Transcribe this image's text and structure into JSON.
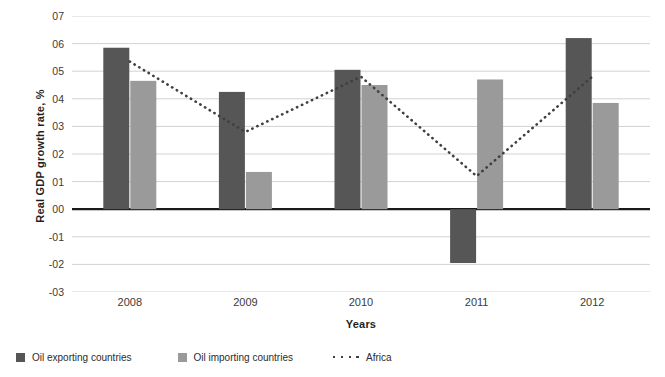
{
  "chart_data": {
    "type": "bar",
    "title": "",
    "xlabel": "Years",
    "ylabel": "Real GDP growth rate, %",
    "categories": [
      "2008",
      "2009",
      "2010",
      "2011",
      "2012"
    ],
    "ylim": [
      -0.03,
      0.07
    ],
    "yticks": [
      0.07,
      0.06,
      0.05,
      0.04,
      0.03,
      0.02,
      0.01,
      0.0,
      -0.01,
      -0.02,
      -0.03
    ],
    "ytick_labels": [
      "07",
      "06",
      "05",
      "04",
      "03",
      "02",
      "01",
      "00",
      "-01",
      "-02",
      "-03"
    ],
    "grid": true,
    "legend_position": "bottom-left",
    "series": [
      {
        "name": "Oil exporting countries",
        "type": "bar",
        "color": "#565656",
        "values": [
          0.0585,
          0.0425,
          0.0505,
          -0.0195,
          0.062
        ]
      },
      {
        "name": "Oil importing countries",
        "type": "bar",
        "color": "#9a9a9a",
        "values": [
          0.0465,
          0.0135,
          0.045,
          0.047,
          0.0385
        ]
      },
      {
        "name": "Africa",
        "type": "line-dotted",
        "color": "#3f3f3f",
        "values": [
          0.0535,
          0.028,
          0.048,
          0.012,
          0.048
        ]
      }
    ]
  },
  "axes": {
    "y_title": "Real GDP growth rate, %",
    "x_title": "Years"
  },
  "legend": {
    "items": [
      {
        "label": "Oil exporting countries",
        "marker": "square-swatch-dark",
        "color": "#565656"
      },
      {
        "label": "Oil importing countries",
        "marker": "square-swatch-light",
        "color": "#9a9a9a"
      },
      {
        "label": "Africa",
        "marker": "dotted-line",
        "color": "#3f3f3f"
      }
    ]
  },
  "colors": {
    "oil_exporting": "#565656",
    "oil_importing": "#9a9a9a",
    "africa": "#3f3f3f",
    "grid": "#d2d2d2",
    "zero_axis": "#1a1a1a",
    "background": "#ffffff"
  }
}
